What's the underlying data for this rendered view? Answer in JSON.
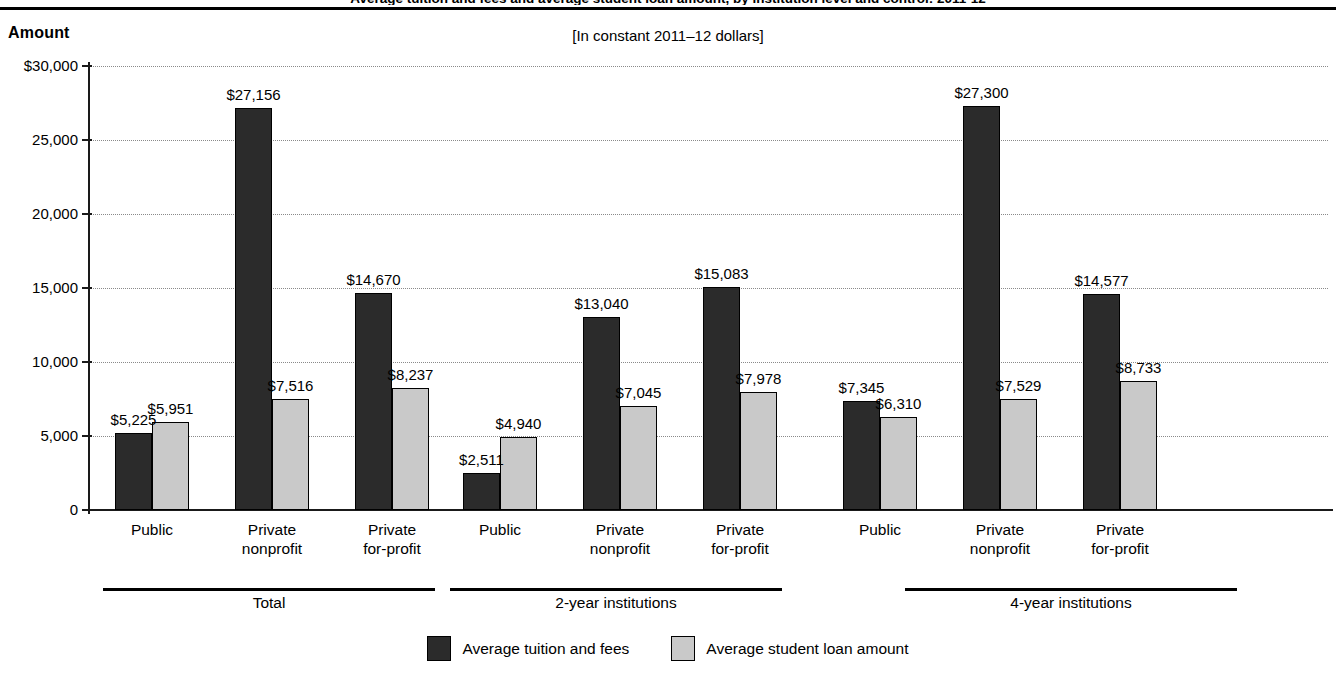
{
  "figure": {
    "clipped_title_line": "Average tuition and fees and average student loan amount, by institution level and control: 2011-12",
    "y_axis_title": "Amount",
    "subtitle": "[In constant 2011–12 dollars]"
  },
  "axis": {
    "y_ticks": [
      "$30,000",
      "25,000",
      "20,000",
      "15,000",
      "10,000",
      "5,000",
      "0"
    ],
    "y_tick_values": [
      30000,
      25000,
      20000,
      15000,
      10000,
      5000,
      0
    ]
  },
  "legend": {
    "items": [
      {
        "label": "Average tuition and fees",
        "color": "#2b2b2b",
        "swatch": "dark"
      },
      {
        "label": "Average student loan amount",
        "color": "#c9c9c9",
        "swatch": "light"
      }
    ]
  },
  "groups": [
    {
      "label": "Total",
      "categories": [
        {
          "label": "Public",
          "tuition": 5225,
          "loan": 5951,
          "tuition_text": "$5,225",
          "loan_text": "$5,951"
        },
        {
          "label": "Private\nnonprofit",
          "tuition": 27156,
          "loan": 7516,
          "tuition_text": "$27,156",
          "loan_text": "$7,516"
        },
        {
          "label": "Private\nfor-profit",
          "tuition": 14670,
          "loan": 8237,
          "tuition_text": "$14,670",
          "loan_text": "$8,237"
        }
      ]
    },
    {
      "label": "2-year institutions",
      "categories": [
        {
          "label": "Public",
          "tuition": 2511,
          "loan": 4940,
          "tuition_text": "$2,511",
          "loan_text": "$4,940"
        },
        {
          "label": "Private\nnonprofit",
          "tuition": 13040,
          "loan": 7045,
          "tuition_text": "$13,040",
          "loan_text": "$7,045"
        },
        {
          "label": "Private\nfor-profit",
          "tuition": 15083,
          "loan": 7978,
          "tuition_text": "$15,083",
          "loan_text": "$7,978"
        }
      ]
    },
    {
      "label": "4-year institutions",
      "categories": [
        {
          "label": "Public",
          "tuition": 7345,
          "loan": 6310,
          "tuition_text": "$7,345",
          "loan_text": "$6,310"
        },
        {
          "label": "Private\nnonprofit",
          "tuition": 27300,
          "loan": 7529,
          "tuition_text": "$27,300",
          "loan_text": "$7,529"
        },
        {
          "label": "Private\nfor-profit",
          "tuition": 14577,
          "loan": 8733,
          "tuition_text": "$14,577",
          "loan_text": "$8,733"
        }
      ]
    }
  ],
  "chart_data": {
    "type": "bar",
    "title": "Average tuition and fees and average student loan amount, by institution level and control: 2011-12",
    "subtitle": "[In constant 2011–12 dollars]",
    "xlabel": "",
    "ylabel": "Amount",
    "ylim": [
      0,
      30000
    ],
    "ytick_values": [
      0,
      5000,
      10000,
      15000,
      20000,
      25000,
      30000
    ],
    "ytick_labels": [
      "0",
      "5,000",
      "10,000",
      "15,000",
      "20,000",
      "25,000",
      "$30,000"
    ],
    "grid": true,
    "legend_position": "bottom-center",
    "groups": [
      "Total",
      "2-year institutions",
      "4-year institutions"
    ],
    "categories": [
      "Total / Public",
      "Total / Private nonprofit",
      "Total / Private for-profit",
      "2-year institutions / Public",
      "2-year institutions / Private nonprofit",
      "2-year institutions / Private for-profit",
      "4-year institutions / Public",
      "4-year institutions / Private nonprofit",
      "4-year institutions / Private for-profit"
    ],
    "series": [
      {
        "name": "Average tuition and fees",
        "color": "#2b2b2b",
        "values": [
          5225,
          27156,
          14670,
          2511,
          13040,
          15083,
          7345,
          27300,
          14577
        ]
      },
      {
        "name": "Average student loan amount",
        "color": "#c9c9c9",
        "values": [
          5951,
          7516,
          8237,
          4940,
          7045,
          7978,
          6310,
          7529,
          8733
        ]
      }
    ]
  }
}
